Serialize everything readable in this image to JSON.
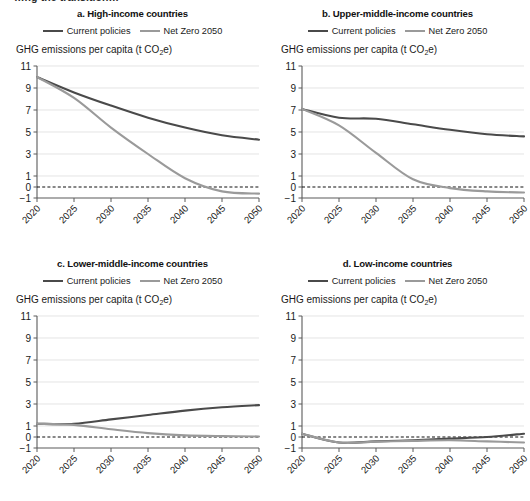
{
  "figure": {
    "cut_off_header": "…ng the transition…",
    "axis_label_prefix": "GHG emissions per capita (t CO",
    "axis_label_sub": "2",
    "axis_label_suffix": "e)",
    "legend": [
      {
        "label": "Current policies",
        "color": "#4a4a4a"
      },
      {
        "label": "Net Zero 2050",
        "color": "#9a9a9a"
      }
    ]
  },
  "colors": {
    "current_policies": "#4a4a4a",
    "net_zero_2050": "#9a9a9a",
    "gridline": "#d9d9d9",
    "axis": "#5a5a5a",
    "zero_line": "#111111",
    "text": "#1a1a1a",
    "background": "#ffffff"
  },
  "panels": [
    {
      "key": "a",
      "title": "a. High-income countries"
    },
    {
      "key": "b",
      "title": "b. Upper-middle-income countries"
    },
    {
      "key": "c",
      "title": "c. Lower-middle-income countries"
    },
    {
      "key": "d",
      "title": "d. Low-income countries"
    }
  ],
  "chart_data": [
    {
      "type": "line",
      "panel": "a",
      "title": "a. High-income countries",
      "xlabel": "",
      "ylabel": "GHG emissions per capita (t CO2e)",
      "x": [
        2020,
        2025,
        2030,
        2035,
        2040,
        2045,
        2050
      ],
      "xlim": [
        2020,
        2050
      ],
      "ylim": [
        -1,
        11
      ],
      "yticks": [
        -1,
        0,
        1,
        3,
        5,
        7,
        9,
        11
      ],
      "xticks": [
        2020,
        2025,
        2030,
        2035,
        2040,
        2045,
        2050
      ],
      "grid": true,
      "legend_position": "top-center",
      "zero_reference_line": 0,
      "series": [
        {
          "name": "Current policies",
          "color": "#4a4a4a",
          "values": [
            10.0,
            8.6,
            7.4,
            6.3,
            5.4,
            4.7,
            4.3
          ]
        },
        {
          "name": "Net Zero 2050",
          "color": "#9a9a9a",
          "values": [
            10.0,
            8.1,
            5.4,
            3.0,
            0.8,
            -0.4,
            -0.6
          ]
        }
      ]
    },
    {
      "type": "line",
      "panel": "b",
      "title": "b. Upper-middle-income countries",
      "xlabel": "",
      "ylabel": "GHG emissions per capita (t CO2e)",
      "x": [
        2020,
        2025,
        2030,
        2035,
        2040,
        2045,
        2050
      ],
      "xlim": [
        2020,
        2050
      ],
      "ylim": [
        -1,
        11
      ],
      "yticks": [
        -1,
        0,
        1,
        3,
        5,
        7,
        9,
        11
      ],
      "xticks": [
        2020,
        2025,
        2030,
        2035,
        2040,
        2045,
        2050
      ],
      "grid": true,
      "legend_position": "top-center",
      "zero_reference_line": 0,
      "series": [
        {
          "name": "Current policies",
          "color": "#4a4a4a",
          "values": [
            7.1,
            6.3,
            6.2,
            5.7,
            5.2,
            4.8,
            4.6
          ]
        },
        {
          "name": "Net Zero 2050",
          "color": "#9a9a9a",
          "values": [
            7.1,
            5.6,
            3.1,
            0.7,
            -0.1,
            -0.4,
            -0.5
          ]
        }
      ]
    },
    {
      "type": "line",
      "panel": "c",
      "title": "c. Lower-middle-income countries",
      "xlabel": "",
      "ylabel": "GHG emissions per capita (t CO2e)",
      "x": [
        2020,
        2025,
        2030,
        2035,
        2040,
        2045,
        2050
      ],
      "xlim": [
        2020,
        2050
      ],
      "ylim": [
        -1,
        11
      ],
      "yticks": [
        -1,
        0,
        1,
        3,
        5,
        7,
        9,
        11
      ],
      "xticks": [
        2020,
        2025,
        2030,
        2035,
        2040,
        2045,
        2050
      ],
      "grid": true,
      "legend_position": "top-center",
      "zero_reference_line": 0,
      "series": [
        {
          "name": "Current policies",
          "color": "#4a4a4a",
          "values": [
            1.2,
            1.2,
            1.6,
            2.0,
            2.4,
            2.7,
            2.9
          ]
        },
        {
          "name": "Net Zero 2050",
          "color": "#9a9a9a",
          "values": [
            1.2,
            1.1,
            0.7,
            0.35,
            0.15,
            0.08,
            0.05
          ]
        }
      ]
    },
    {
      "type": "line",
      "panel": "d",
      "title": "d. Low-income countries",
      "xlabel": "",
      "ylabel": "GHG emissions per capita (t CO2e)",
      "x": [
        2020,
        2025,
        2030,
        2035,
        2040,
        2045,
        2050
      ],
      "xlim": [
        2020,
        2050
      ],
      "ylim": [
        -1,
        11
      ],
      "yticks": [
        -1,
        0,
        1,
        3,
        5,
        7,
        9,
        11
      ],
      "xticks": [
        2020,
        2025,
        2030,
        2035,
        2040,
        2045,
        2050
      ],
      "grid": true,
      "legend_position": "top-center",
      "zero_reference_line": 0,
      "series": [
        {
          "name": "Current policies",
          "color": "#4a4a4a",
          "values": [
            0.3,
            -0.5,
            -0.4,
            -0.3,
            -0.15,
            0.0,
            0.3
          ]
        },
        {
          "name": "Net Zero 2050",
          "color": "#9a9a9a",
          "values": [
            0.3,
            -0.5,
            -0.42,
            -0.35,
            -0.3,
            -0.4,
            -0.5
          ]
        }
      ]
    }
  ]
}
